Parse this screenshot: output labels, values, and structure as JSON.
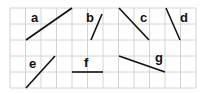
{
  "grid": {
    "x0": 10,
    "y0": 8,
    "cols": 12,
    "rows": 5,
    "cell_w": 15.5,
    "cell_h": 16,
    "line_color": "#d4d4d4",
    "bg": "#ffffff"
  },
  "segments": [
    {
      "label": "a",
      "x1": 26,
      "y1": 40,
      "x2": 72,
      "y2": 8,
      "lx": 31,
      "ly": 22
    },
    {
      "label": "b",
      "x1": 91,
      "y1": 40,
      "x2": 102,
      "y2": 14,
      "lx": 86,
      "ly": 22
    },
    {
      "label": "c",
      "x1": 119,
      "y1": 8,
      "x2": 149,
      "y2": 40,
      "lx": 140,
      "ly": 22
    },
    {
      "label": "d",
      "x1": 166,
      "y1": 8,
      "x2": 180,
      "y2": 40,
      "lx": 180,
      "ly": 22
    },
    {
      "label": "e",
      "x1": 26,
      "y1": 88,
      "x2": 55,
      "y2": 56,
      "lx": 29,
      "ly": 68
    },
    {
      "label": "f",
      "x1": 72,
      "y1": 72,
      "x2": 103,
      "y2": 72,
      "lx": 84,
      "ly": 67
    },
    {
      "label": "g",
      "x1": 119,
      "y1": 56,
      "x2": 165,
      "y2": 72,
      "lx": 155,
      "ly": 62
    }
  ],
  "stroke_color": "#111111"
}
